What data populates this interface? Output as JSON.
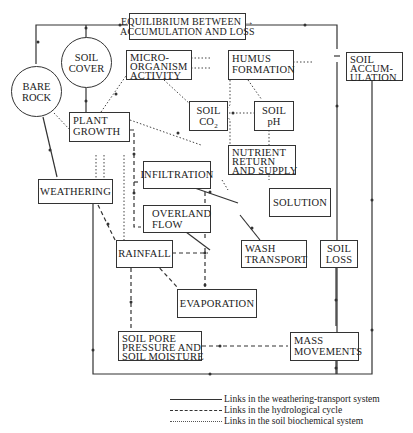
{
  "diagram": {
    "nodes": {
      "equilibrium": {
        "label": "EQUILIBRIUM BETWEEN →\nACCUMULATION AND LOSS"
      },
      "soil_cover": {
        "label": "SOIL\nCOVER"
      },
      "bare_rock": {
        "label": "BARE\nROCK"
      },
      "micro_organism": {
        "label": "MICRO-\nORGANISM\nACTIVITY"
      },
      "humus_formation": {
        "label": "HUMUS\nFORMATION"
      },
      "soil_accumulation": {
        "label": "SOIL\nACCUM-\nULATION"
      },
      "soil_co2": {
        "label": "SOIL\nCO",
        "sub": "2"
      },
      "soil_ph": {
        "label": "SOIL\npH"
      },
      "plant_growth": {
        "label": "PLANT\nGROWTH"
      },
      "nutrient_return": {
        "label": "NUTRIENT\nRETURN\nAND SUPPLY"
      },
      "infiltration": {
        "label": "INFILTRATION"
      },
      "weathering": {
        "label": "WEATHERING"
      },
      "solution": {
        "label": "SOLUTION"
      },
      "overland_flow": {
        "label": "OVERLAND\nFLOW"
      },
      "wash_transport": {
        "label": "WASH\nTRANSPORT"
      },
      "soil_loss": {
        "label": "SOIL\nLOSS"
      },
      "rainfall": {
        "label": "RAINFALL"
      },
      "evaporation": {
        "label": "EVAPORATION"
      },
      "soil_pore": {
        "label": "SOIL PORE\nPRESSURE AND\nSOIL MOISTURE"
      },
      "mass_movements": {
        "label": "MASS\nMOVEMENTS"
      }
    },
    "legend": [
      {
        "style": "solid",
        "label": "Links in the weathering-transport system"
      },
      {
        "style": "dashed",
        "label": "Links in the hydrological cycle"
      },
      {
        "style": "dotted",
        "label": "Links in the soil biochemical system"
      }
    ]
  }
}
